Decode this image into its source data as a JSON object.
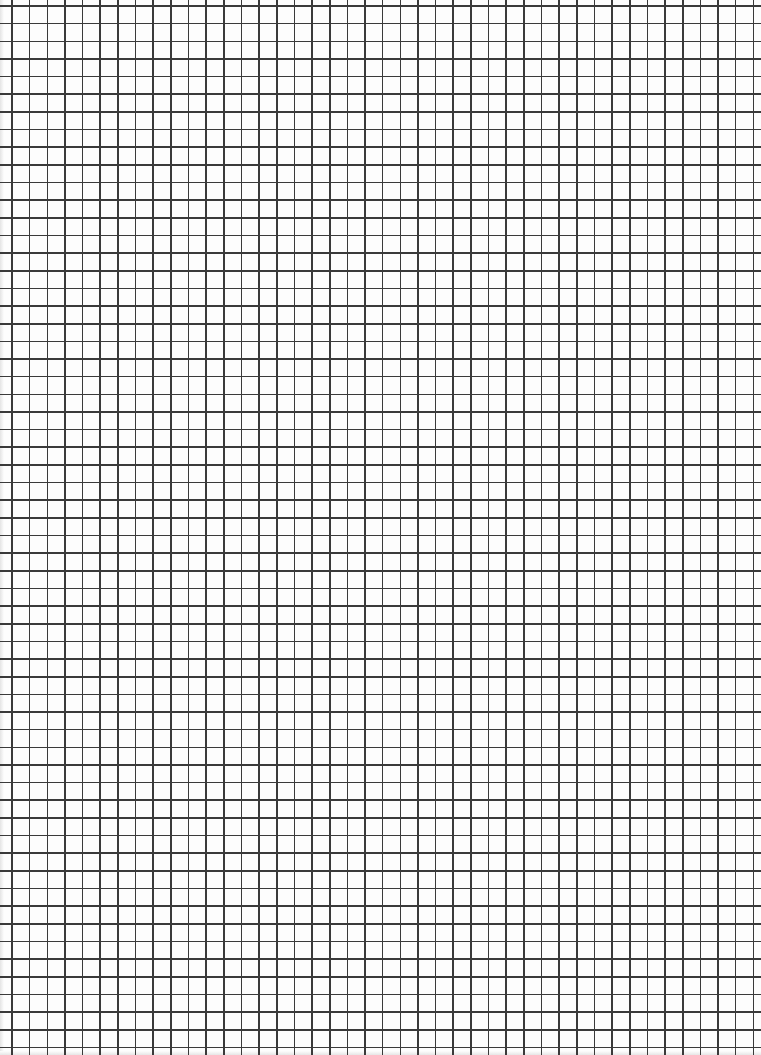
{
  "sheet": {
    "type": "graph paper",
    "background_color": "#fdfdfd",
    "line_color": "#3a3a3a",
    "line_width": 1.6
  },
  "grid": {
    "origin_x": 12,
    "origin_y": 6,
    "spacing": 17.65,
    "columns": 43,
    "rows": 59,
    "width": 761,
    "height": 1055
  }
}
